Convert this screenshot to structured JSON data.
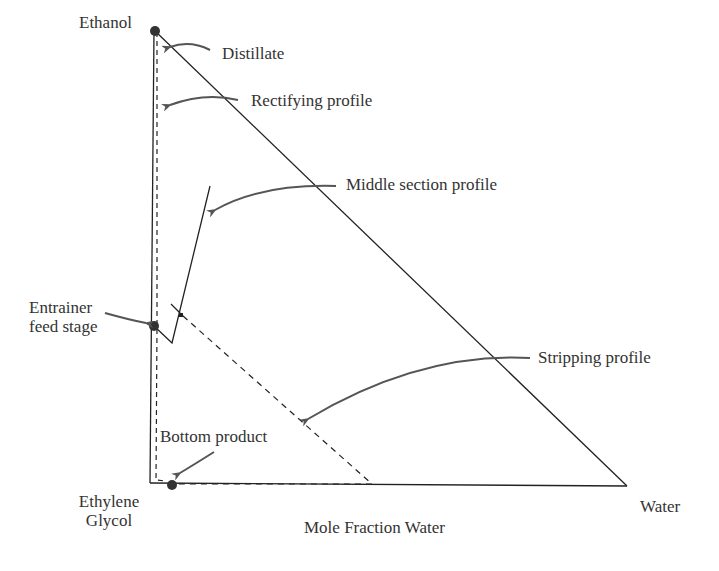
{
  "vertices": {
    "top": "Ethanol",
    "bottom_left_line1": "Ethylene",
    "bottom_left_line2": "Glycol",
    "bottom_right": "Water"
  },
  "axis": {
    "xlabel": "Mole Fraction Water"
  },
  "annotations": {
    "distillate": "Distillate",
    "rectifying": "Rectifying profile",
    "middle": "Middle section profile",
    "entrainer_line1": "Entrainer",
    "entrainer_line2": "feed stage",
    "stripping": "Stripping profile",
    "bottom": "Bottom product"
  },
  "colors": {
    "line": "#222222",
    "arrow": "#555555",
    "point": "#333333"
  }
}
